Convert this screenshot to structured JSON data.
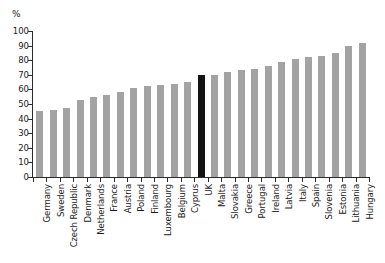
{
  "chart_data": {
    "type": "bar",
    "title": "",
    "subtitle": "",
    "xlabel": "",
    "ylabel": "%",
    "unit_label": "%",
    "ylim": [
      0,
      100
    ],
    "yticks": [
      0,
      10,
      20,
      30,
      40,
      50,
      60,
      70,
      80,
      90,
      100
    ],
    "grid": false,
    "legend": null,
    "legend_position": "none",
    "bar_color": "#a3a3a3",
    "highlight_color": "#131313",
    "highlight_category": "UK",
    "categories": [
      "Germany",
      "Sweden",
      "Czech Republic",
      "Denmark",
      "Netherlands",
      "France",
      "Austria",
      "Poland",
      "Finland",
      "Luxembourg",
      "Belgium",
      "Cyprus",
      "UK",
      "Malta",
      "Slovakia",
      "Greece",
      "Portugal",
      "Ireland",
      "Latvia",
      "Italy",
      "Spain",
      "Slovenia",
      "Estonia",
      "Lithuania",
      "Hungary"
    ],
    "values": [
      45,
      46,
      47,
      53,
      55,
      56,
      58,
      61,
      62,
      63,
      64,
      65,
      70,
      70,
      72,
      73,
      74,
      76,
      79,
      81,
      82,
      83,
      85,
      90,
      92
    ]
  }
}
